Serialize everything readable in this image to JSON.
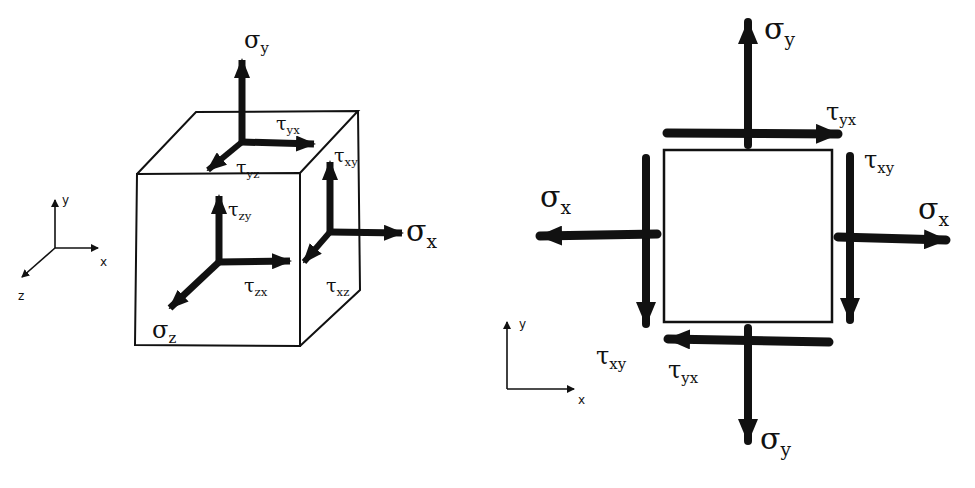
{
  "diagram": {
    "title": "",
    "ink_color": "#111111",
    "background": "#ffffff",
    "left_panel": {
      "description": "3D stress element (cube)",
      "axes": {
        "x": "x",
        "y": "y",
        "z": "z"
      },
      "labels": {
        "sigma_y": {
          "sym": "σ",
          "sub": "y"
        },
        "tau_yx": {
          "sym": "τ",
          "sub": "yx"
        },
        "tau_yz": {
          "sym": "τ",
          "sub": "yz"
        },
        "tau_xy": {
          "sym": "τ",
          "sub": "xy"
        },
        "tau_zy": {
          "sym": "τ",
          "sub": "zy"
        },
        "sigma_x": {
          "sym": "σ",
          "sub": "x"
        },
        "tau_zx": {
          "sym": "τ",
          "sub": "zx"
        },
        "tau_xz": {
          "sym": "τ",
          "sub": "xz"
        },
        "sigma_z": {
          "sym": "σ",
          "sub": "z"
        }
      }
    },
    "right_panel": {
      "description": "2D plane stress element",
      "axes": {
        "x": "x",
        "y": "y"
      },
      "labels": {
        "sigma_y_top": {
          "sym": "σ",
          "sub": "y"
        },
        "tau_yx_top": {
          "sym": "τ",
          "sub": "yx"
        },
        "tau_xy_right": {
          "sym": "τ",
          "sub": "xy"
        },
        "sigma_x_left": {
          "sym": "σ",
          "sub": "x"
        },
        "sigma_x_right": {
          "sym": "σ",
          "sub": "x"
        },
        "tau_xy_left": {
          "sym": "τ",
          "sub": "xy"
        },
        "tau_yx_bottom": {
          "sym": "τ",
          "sub": "yx"
        },
        "sigma_y_bottom": {
          "sym": "σ",
          "sub": "y"
        }
      }
    }
  }
}
